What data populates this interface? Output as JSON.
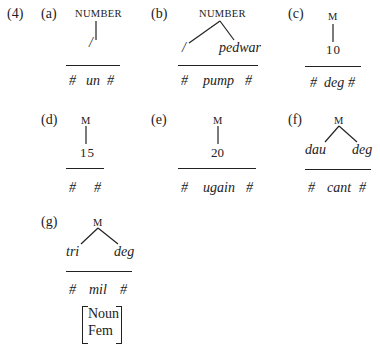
{
  "example_number": "(4)",
  "panels": {
    "a": {
      "label": "(a)",
      "root": "NUMBER",
      "leaves": [
        "/"
      ],
      "form": [
        "#",
        "un",
        "#"
      ]
    },
    "b": {
      "label": "(b)",
      "root": "NUMBER",
      "leaves": [
        "/",
        "pedwar"
      ],
      "form": [
        "#",
        "pump",
        "#"
      ]
    },
    "c": {
      "label": "(c)",
      "root": "M",
      "leaves": [
        "10"
      ],
      "form": [
        "#",
        "deg",
        "#"
      ]
    },
    "d": {
      "label": "(d)",
      "root": "M",
      "leaves": [
        "15"
      ],
      "form": [
        "#",
        "#"
      ]
    },
    "e": {
      "label": "(e)",
      "root": "M",
      "leaves": [
        "20"
      ],
      "form": [
        "#",
        "ugain",
        "#"
      ]
    },
    "f": {
      "label": "(f)",
      "root": "M",
      "leaves": [
        "dau",
        "deg"
      ],
      "form": [
        "#",
        "cant",
        "#"
      ]
    },
    "g": {
      "label": "(g)",
      "root": "M",
      "leaves": [
        "tri",
        "deg"
      ],
      "form": [
        "#",
        "mil",
        "#"
      ],
      "features": [
        "Noun",
        "Fem"
      ]
    }
  }
}
